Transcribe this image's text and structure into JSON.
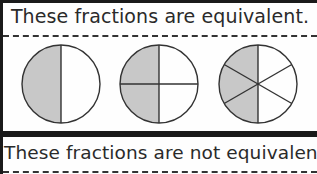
{
  "sections": [
    {
      "title": "These fractions are equivalent.",
      "fractions": [
        {
          "label": "1/2",
          "parts": 2,
          "shaded": 1
        },
        {
          "label": "2/4",
          "parts": 4,
          "shaded": 2
        },
        {
          "label": "3/6",
          "parts": 6,
          "shaded": 3
        }
      ]
    },
    {
      "title": "These fractions are not equivalent."
    }
  ],
  "colors": {
    "shade": "#c8c8c8",
    "stroke": "#333333",
    "border": "#1a1a1a"
  }
}
